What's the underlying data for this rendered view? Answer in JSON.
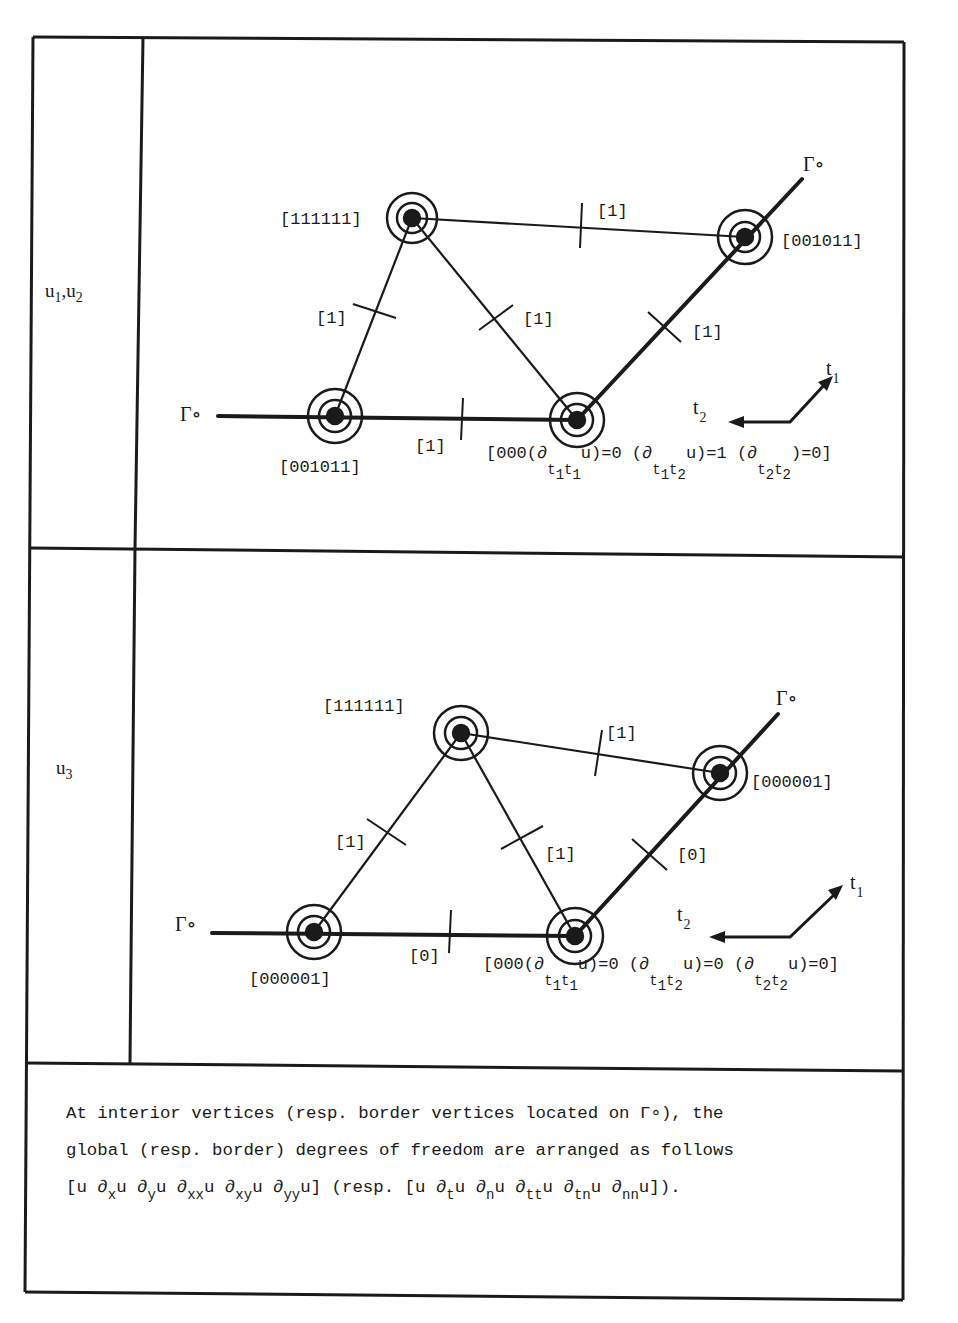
{
  "figure": {
    "rows": [
      {
        "id": "u12",
        "label_main": "u",
        "label_sub1": "1",
        "label_sep": ",u",
        "label_sub2": "2",
        "vertices": {
          "top": {
            "label": "[111111]"
          },
          "right": {
            "label": "[001011]"
          },
          "left": {
            "label": "[001011]"
          },
          "bottom": {
            "label_prefix": "[000(∂",
            "label_sub_a": "t",
            "label_sub_a1": "1",
            "label_sub_b": "t",
            "label_sub_b1": "1",
            "label_rest1": "u)=0  (∂",
            "label_sub2_a": "t",
            "label_sub2_a1": "1",
            "label_sub2_b": "t",
            "label_sub2_b1": "2",
            "label_rest2": "u)=1  (∂",
            "label_sub3_a": "t",
            "label_sub3_a1": "2",
            "label_sub3_b": "t",
            "label_sub3_b1": "2",
            "label_rest3": ")=0]"
          }
        },
        "edges": {
          "top_right": "[1]",
          "left_top": "[1]",
          "top_bottom": "[1]",
          "bottom_right": "[1]",
          "left_bottom": "[1]"
        },
        "boundary_label": "Γ∘",
        "boundary_label_right": "Γ∘",
        "axes": {
          "t1": "t",
          "t1_sub": "1",
          "t2": "t",
          "t2_sub": "2"
        }
      },
      {
        "id": "u3",
        "label_main": "u",
        "label_sub1": "3",
        "vertices": {
          "top": {
            "label": "[111111]"
          },
          "right": {
            "label": "[000001]"
          },
          "left": {
            "label": "[000001]"
          },
          "bottom": {
            "label_prefix": "[000(∂",
            "label_rest1": "u)=0  (∂",
            "label_rest2": "u)=0  (∂",
            "label_rest3": "u)=0]"
          }
        },
        "edges": {
          "top_right": "[1]",
          "left_top": "[1]",
          "top_bottom": "[1]",
          "bottom_right": "[0]",
          "left_bottom": "[0]"
        },
        "boundary_label": "Γ∘",
        "boundary_label_right": "Γ∘",
        "axes": {
          "t1": "t",
          "t1_sub": "1",
          "t2": "t",
          "t2_sub": "2"
        }
      }
    ],
    "caption": {
      "line1": "At interior vertices (resp. border vertices located on Γ∘), the",
      "line2": "global (resp. border) degrees of freedom are arranged as follows",
      "line3_parts": [
        "[u ∂",
        "x",
        "u ∂",
        "y",
        "u ∂",
        "xx",
        "u ∂",
        "xy",
        "u ∂",
        "yy",
        "u]  (resp. [u ∂",
        "t",
        "u ∂",
        "n",
        "u ∂",
        "tt",
        "u ∂",
        "tn",
        "u ∂",
        "nn",
        "u])."
      ]
    }
  }
}
